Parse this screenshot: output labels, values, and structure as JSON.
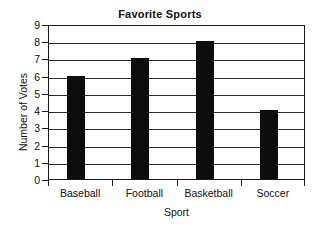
{
  "chart_data": {
    "type": "bar",
    "title": "Favorite Sports",
    "xlabel": "Sport",
    "ylabel": "Number of Votes",
    "categories": [
      "Baseball",
      "Football",
      "Basketball",
      "Soccer"
    ],
    "values": [
      6,
      7,
      8,
      4
    ],
    "ylim": [
      0,
      9
    ],
    "ytick_labels": [
      "0",
      "1",
      "2",
      "3",
      "4",
      "5",
      "6",
      "7",
      "8",
      "9"
    ],
    "ytick_values": [
      0,
      1,
      2,
      3,
      4,
      5,
      6,
      7,
      8,
      9
    ],
    "grid": true,
    "grid_axis": "y",
    "legend": false,
    "bar_color": "#0d0d0d",
    "axis_color": "#1b1b1b",
    "grid_color": "#2b2b2b",
    "background_color": "#ffffff"
  }
}
